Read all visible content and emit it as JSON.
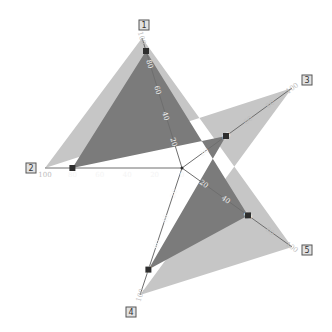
{
  "chart_data": {
    "type": "radar",
    "title": "",
    "categories": [
      "1",
      "2",
      "3",
      "4",
      "5"
    ],
    "axis_range": [
      0,
      100
    ],
    "ticks": [
      0,
      20,
      40,
      60,
      80,
      100
    ],
    "series": [
      {
        "name": "max",
        "values": [
          100,
          100,
          100,
          100,
          100
        ],
        "color": "#c8c8c8"
      },
      {
        "name": "data",
        "values": [
          90,
          80,
          40,
          80,
          60
        ],
        "color": "#7a7a7a"
      }
    ],
    "legend": "none",
    "grid": false
  },
  "colors": {
    "outer_fill": "#c6c6c6",
    "inner_fill": "#7b7b7b",
    "marker": "#2e2e2e",
    "axis": "#6e6e6e"
  }
}
